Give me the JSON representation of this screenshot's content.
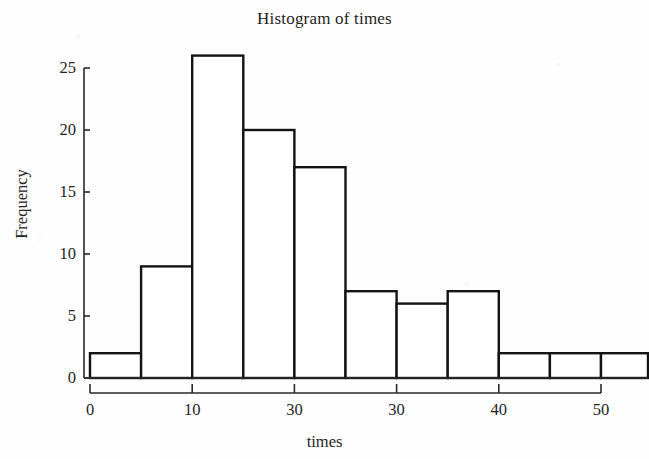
{
  "chart_data": {
    "type": "bar",
    "title": "Histogram of times",
    "xlabel": "times",
    "ylabel": "Frequency",
    "categories": [
      "0-5",
      "5-10",
      "10-15",
      "15-20",
      "20-25",
      "25-30",
      "30-35",
      "35-40",
      "40-45",
      "45-50",
      "50-55"
    ],
    "bin_edges": [
      0,
      5,
      10,
      15,
      20,
      25,
      30,
      35,
      40,
      45,
      50,
      55
    ],
    "values": [
      2,
      9,
      26,
      20,
      17,
      7,
      6,
      7,
      2,
      2,
      2
    ],
    "bin_width": 5,
    "xlim": [
      0,
      55
    ],
    "ylim": [
      0,
      26
    ],
    "x_ticks": [
      0,
      10,
      20,
      30,
      40,
      50
    ],
    "x_tick_labels": [
      "0",
      "10",
      "30",
      "30",
      "40",
      "50"
    ],
    "y_ticks": [
      0,
      5,
      10,
      15,
      20,
      25
    ],
    "y_tick_labels": [
      "0",
      "5",
      "10",
      "15",
      "20",
      "25"
    ],
    "grid": false,
    "legend": false,
    "bar_fill": "#ffffff",
    "bar_stroke": "#141414",
    "axis_color": "#2a2a2a",
    "background": "#fefefe"
  }
}
